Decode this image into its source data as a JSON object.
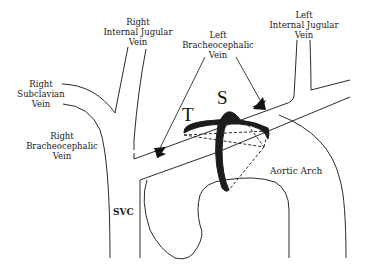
{
  "diagram": {
    "type": "anatomical-line-drawing",
    "labels": {
      "right_internal_jugular": [
        "Right",
        "Internal Jugular",
        "Vein"
      ],
      "left_internal_jugular": [
        "Left",
        "Internal Jugular",
        "Vein"
      ],
      "left_brachiocephalic": [
        "Left",
        "Bracheocephalic",
        "Vein"
      ],
      "right_subclavian": [
        "Right",
        "Subclavian",
        "Vein"
      ],
      "right_brachiocephalic": [
        "Right",
        "Bracheocephalic",
        "Vein"
      ],
      "svc": "SVC",
      "aortic_arch": "Aortic Arch"
    },
    "markers": {
      "t": "T",
      "s": "S"
    },
    "colors": {
      "line": "#2a2a2a",
      "band": "#1c1c1c",
      "background": "#ffffff"
    }
  }
}
